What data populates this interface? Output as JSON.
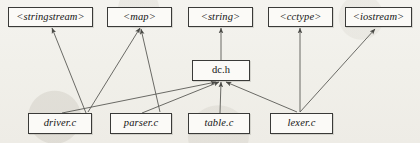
{
  "diagram": {
    "background_color": "#f2f1ed",
    "node_fill": "#fbfaf7",
    "node_border": "#3a3a38",
    "edge_color": "#5a5a56",
    "nodes": [
      {
        "id": "stringstream",
        "label": "<stringstream>",
        "style": "italic",
        "row": "top",
        "x": 8,
        "y": 7,
        "w": 85,
        "h": 20
      },
      {
        "id": "map",
        "label": "<map>",
        "style": "italic",
        "row": "top",
        "x": 107,
        "y": 7,
        "w": 65,
        "h": 20
      },
      {
        "id": "string",
        "label": "<string>",
        "style": "italic",
        "row": "top",
        "x": 188,
        "y": 7,
        "w": 65,
        "h": 20
      },
      {
        "id": "cctype",
        "label": "<cctype>",
        "style": "italic",
        "row": "top",
        "x": 268,
        "y": 7,
        "w": 65,
        "h": 20
      },
      {
        "id": "iostream",
        "label": "<iostream>",
        "style": "italic",
        "row": "top",
        "x": 345,
        "y": 7,
        "w": 67,
        "h": 20
      },
      {
        "id": "dch",
        "label": "dc.h",
        "style": "normal",
        "row": "middle",
        "x": 192,
        "y": 60,
        "w": 58,
        "h": 21
      },
      {
        "id": "driverc",
        "label": "driver.c",
        "style": "italic",
        "row": "bottom",
        "x": 28,
        "y": 113,
        "w": 64,
        "h": 21
      },
      {
        "id": "parserc",
        "label": "parser.c",
        "style": "italic",
        "row": "bottom",
        "x": 110,
        "y": 113,
        "w": 62,
        "h": 21
      },
      {
        "id": "tablec",
        "label": "table.c",
        "style": "italic",
        "row": "bottom",
        "x": 188,
        "y": 113,
        "w": 62,
        "h": 21
      },
      {
        "id": "lexerc",
        "label": "lexer.c",
        "style": "italic",
        "row": "bottom",
        "x": 270,
        "y": 113,
        "w": 63,
        "h": 21
      }
    ],
    "edges": [
      {
        "from": "driverc",
        "to": "stringstream",
        "x1": 86,
        "y1": 113,
        "x2": 52,
        "y2": 28
      },
      {
        "from": "driverc",
        "to": "map",
        "x1": 88,
        "y1": 112,
        "x2": 140,
        "y2": 28
      },
      {
        "from": "parserc",
        "to": "map",
        "x1": 160,
        "y1": 112,
        "x2": 141,
        "y2": 29
      },
      {
        "from": "dch",
        "to": "string",
        "x1": 221,
        "y1": 60,
        "x2": 221,
        "y2": 28
      },
      {
        "from": "lexerc",
        "to": "cctype",
        "x1": 300,
        "y1": 112,
        "x2": 300,
        "y2": 28
      },
      {
        "from": "lexerc",
        "to": "iostream",
        "x1": 300,
        "y1": 112,
        "x2": 375,
        "y2": 29
      },
      {
        "from": "driverc",
        "to": "dch",
        "x1": 62,
        "y1": 113,
        "x2": 216,
        "y2": 82
      },
      {
        "from": "parserc",
        "to": "dch",
        "x1": 142,
        "y1": 113,
        "x2": 219,
        "y2": 82
      },
      {
        "from": "tablec",
        "to": "dch",
        "x1": 220,
        "y1": 113,
        "x2": 221,
        "y2": 82
      },
      {
        "from": "lexerc",
        "to": "dch",
        "x1": 297,
        "y1": 112,
        "x2": 226,
        "y2": 82
      }
    ]
  }
}
